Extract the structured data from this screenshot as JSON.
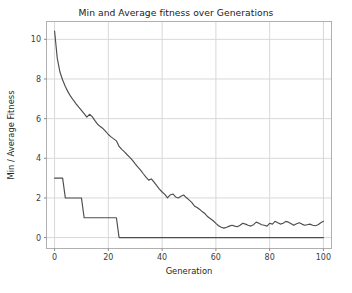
{
  "chart_data": {
    "type": "line",
    "title": "Min and Average fitness over Generations",
    "xlabel": "Generation",
    "ylabel": "Min / Average Fitness",
    "xlim": [
      -3,
      103
    ],
    "ylim": [
      -0.55,
      10.9
    ],
    "xticks": [
      0,
      20,
      40,
      60,
      80,
      100
    ],
    "yticks": [
      0,
      2,
      4,
      6,
      8,
      10
    ],
    "xticklabels": [
      "0",
      "20",
      "40",
      "60",
      "80",
      "100"
    ],
    "yticklabels": [
      "0",
      "2",
      "4",
      "6",
      "8",
      "10"
    ],
    "grid": true,
    "legend": "none",
    "line_color": "#4d4d4d",
    "grid_color": "#d8d8d8",
    "background_color": "#ffffff",
    "x": [
      0,
      1,
      2,
      3,
      4,
      5,
      6,
      7,
      8,
      9,
      10,
      11,
      12,
      13,
      14,
      15,
      16,
      17,
      18,
      19,
      20,
      21,
      22,
      23,
      24,
      25,
      26,
      27,
      28,
      29,
      30,
      31,
      32,
      33,
      34,
      35,
      36,
      37,
      38,
      39,
      40,
      41,
      42,
      43,
      44,
      45,
      46,
      47,
      48,
      49,
      50,
      51,
      52,
      53,
      54,
      55,
      56,
      57,
      58,
      59,
      60,
      61,
      62,
      63,
      64,
      65,
      66,
      67,
      68,
      69,
      70,
      71,
      72,
      73,
      74,
      75,
      76,
      77,
      78,
      79,
      80,
      81,
      82,
      83,
      84,
      85,
      86,
      87,
      88,
      89,
      90,
      91,
      92,
      93,
      94,
      95,
      96,
      97,
      98,
      99,
      100
    ],
    "series": [
      {
        "name": "Average fitness",
        "values": [
          10.42,
          9.05,
          8.35,
          7.95,
          7.62,
          7.35,
          7.12,
          6.93,
          6.75,
          6.58,
          6.42,
          6.25,
          6.08,
          6.22,
          6.1,
          5.9,
          5.72,
          5.6,
          5.5,
          5.36,
          5.2,
          5.08,
          4.98,
          4.88,
          4.6,
          4.45,
          4.32,
          4.18,
          4.05,
          3.9,
          3.72,
          3.55,
          3.4,
          3.22,
          3.05,
          2.9,
          2.96,
          2.8,
          2.62,
          2.45,
          2.3,
          2.18,
          2.0,
          2.15,
          2.2,
          2.05,
          2.0,
          2.08,
          2.15,
          2.02,
          1.9,
          1.78,
          1.6,
          1.52,
          1.42,
          1.3,
          1.2,
          1.05,
          0.95,
          0.85,
          0.72,
          0.6,
          0.52,
          0.48,
          0.52,
          0.58,
          0.62,
          0.58,
          0.55,
          0.62,
          0.72,
          0.68,
          0.62,
          0.58,
          0.65,
          0.78,
          0.72,
          0.65,
          0.62,
          0.58,
          0.72,
          0.68,
          0.82,
          0.75,
          0.68,
          0.72,
          0.82,
          0.78,
          0.7,
          0.62,
          0.7,
          0.75,
          0.68,
          0.62,
          0.65,
          0.68,
          0.62,
          0.6,
          0.65,
          0.75,
          0.82
        ]
      },
      {
        "name": "Min fitness",
        "values": [
          3,
          3,
          3,
          3,
          2,
          2,
          2,
          2,
          2,
          2,
          2,
          1,
          1,
          1,
          1,
          1,
          1,
          1,
          1,
          1,
          1,
          1,
          1,
          1,
          0,
          0,
          0,
          0,
          0,
          0,
          0,
          0,
          0,
          0,
          0,
          0,
          0,
          0,
          0,
          0,
          0,
          0,
          0,
          0,
          0,
          0,
          0,
          0,
          0,
          0,
          0,
          0,
          0,
          0,
          0,
          0,
          0,
          0,
          0,
          0,
          0,
          0,
          0,
          0,
          0,
          0,
          0,
          0,
          0,
          0,
          0,
          0,
          0,
          0,
          0,
          0,
          0,
          0,
          0,
          0,
          0,
          0,
          0,
          0,
          0,
          0,
          0,
          0,
          0,
          0,
          0,
          0,
          0,
          0,
          0,
          0,
          0,
          0,
          0,
          0,
          0
        ]
      }
    ]
  }
}
